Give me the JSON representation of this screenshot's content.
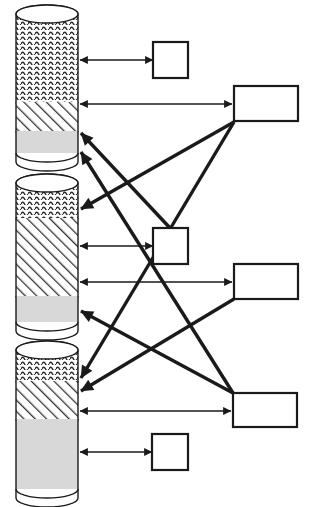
{
  "figure": {
    "title": "",
    "type": "block-diagram",
    "width": 314,
    "height": 507,
    "background": "#ffffff"
  },
  "style": {
    "stroke": "#1a1a1a",
    "thin_stroke_width": 1.6,
    "thick_stroke_width": 3.4,
    "box_stroke_width": 2.2,
    "cylinder_stroke_width": 1.4,
    "fill_white": "#ffffff",
    "fill_gray": "#d8d8d8",
    "hatch_color": "#333333",
    "wave_color": "#2b2b2b"
  },
  "cylinders": [
    {
      "name": "cylinder-top",
      "x": 16,
      "y": 14,
      "width": 62,
      "height": 148,
      "ellipse_ry": 9,
      "segments": [
        {
          "name": "wave-segment",
          "pattern": "wavy",
          "from": 14,
          "to": 102,
          "fill": "#ffffff"
        },
        {
          "name": "hatch-segment",
          "pattern": "diagonal-hatch",
          "from": 102,
          "to": 131,
          "fill": "#ffffff"
        },
        {
          "name": "solid-segment",
          "pattern": "solid-gray",
          "from": 131,
          "to": 153,
          "fill": "#d8d8d8"
        }
      ]
    },
    {
      "name": "cylinder-middle",
      "x": 16,
      "y": 183,
      "width": 62,
      "height": 148,
      "ellipse_ry": 9,
      "segments": [
        {
          "name": "wave-segment",
          "pattern": "wavy",
          "from": 183,
          "to": 218,
          "fill": "#ffffff"
        },
        {
          "name": "hatch-segment",
          "pattern": "diagonal-hatch",
          "from": 218,
          "to": 296,
          "fill": "#ffffff"
        },
        {
          "name": "solid-segment",
          "pattern": "solid-gray",
          "from": 296,
          "to": 322,
          "fill": "#d8d8d8"
        }
      ]
    },
    {
      "name": "cylinder-bottom",
      "x": 16,
      "y": 350,
      "width": 62,
      "height": 148,
      "ellipse_ry": 9,
      "segments": [
        {
          "name": "wave-segment",
          "pattern": "wavy",
          "from": 350,
          "to": 381,
          "fill": "#ffffff"
        },
        {
          "name": "hatch-segment",
          "pattern": "diagonal-hatch",
          "from": 381,
          "to": 419,
          "fill": "#ffffff"
        },
        {
          "name": "solid-segment",
          "pattern": "solid-gray",
          "from": 419,
          "to": 489,
          "fill": "#d8d8d8"
        }
      ]
    }
  ],
  "boxes": [
    {
      "name": "small-box-top",
      "label": "",
      "x": 153,
      "y": 42,
      "width": 35,
      "height": 36,
      "shape": "square"
    },
    {
      "name": "wide-box-top",
      "label": "",
      "x": 234,
      "y": 86,
      "width": 64,
      "height": 35,
      "shape": "rectangle"
    },
    {
      "name": "small-box-middle",
      "label": "",
      "x": 153,
      "y": 228,
      "width": 35,
      "height": 36,
      "shape": "square"
    },
    {
      "name": "wide-box-middle",
      "label": "",
      "x": 234,
      "y": 264,
      "width": 64,
      "height": 35,
      "shape": "rectangle"
    },
    {
      "name": "wide-box-bottom",
      "label": "",
      "x": 233,
      "y": 393,
      "width": 64,
      "height": 34,
      "shape": "rectangle"
    },
    {
      "name": "small-box-bottom",
      "label": "",
      "x": 152,
      "y": 434,
      "width": 36,
      "height": 36,
      "shape": "square"
    }
  ],
  "connections": [
    {
      "name": "link-cyl-top-wave-to-small-box-top",
      "kind": "thin",
      "arrows": "both",
      "from": {
        "x": 153,
        "y": 60
      },
      "to": {
        "x": 80,
        "y": 60
      }
    },
    {
      "name": "link-cyl-top-hatch-to-wide-box-top",
      "kind": "thin",
      "arrows": "both",
      "from": {
        "x": 232,
        "y": 104
      },
      "to": {
        "x": 80,
        "y": 104
      }
    },
    {
      "name": "link-cyl-mid-hatch-to-small-box-middle",
      "kind": "thin",
      "arrows": "both",
      "from": {
        "x": 153,
        "y": 246
      },
      "to": {
        "x": 80,
        "y": 246
      }
    },
    {
      "name": "link-cyl-mid-hatch-low-to-wide-box-middle",
      "kind": "thin",
      "arrows": "both",
      "from": {
        "x": 232,
        "y": 282
      },
      "to": {
        "x": 80,
        "y": 282
      }
    },
    {
      "name": "link-cyl-bottom-hatch-to-wide-box-bottom",
      "kind": "thin",
      "arrows": "both",
      "from": {
        "x": 231,
        "y": 411
      },
      "to": {
        "x": 80,
        "y": 411
      }
    },
    {
      "name": "link-cyl-bottom-solid-to-small-box-bottom",
      "kind": "thin",
      "arrows": "both",
      "from": {
        "x": 152,
        "y": 452
      },
      "to": {
        "x": 80,
        "y": 452
      }
    },
    {
      "name": "link-wide-box-top-to-cyl-mid-wave",
      "kind": "thick",
      "arrows": "end",
      "from": {
        "x": 234,
        "y": 122
      },
      "to": {
        "x": 81,
        "y": 209
      }
    },
    {
      "name": "link-wide-box-top-to-cyl-bottom-wave",
      "kind": "thick",
      "arrows": "end",
      "from": {
        "x": 234,
        "y": 122
      },
      "to": {
        "x": 81,
        "y": 378
      }
    },
    {
      "name": "link-small-box-middle-to-cyl-top-hatch",
      "kind": "thick",
      "arrows": "end",
      "from": {
        "x": 170,
        "y": 228
      },
      "to": {
        "x": 81,
        "y": 133
      }
    },
    {
      "name": "link-wide-box-middle-to-cyl-bottom-hatch",
      "kind": "thick",
      "arrows": "end",
      "from": {
        "x": 234,
        "y": 299
      },
      "to": {
        "x": 81,
        "y": 391
      }
    },
    {
      "name": "link-wide-box-bottom-to-cyl-top-solid",
      "kind": "thick",
      "arrows": "end",
      "from": {
        "x": 233,
        "y": 393
      },
      "to": {
        "x": 81,
        "y": 152
      }
    },
    {
      "name": "link-wide-box-bottom-to-cyl-mid-solid",
      "kind": "thick",
      "arrows": "end",
      "from": {
        "x": 233,
        "y": 393
      },
      "to": {
        "x": 81,
        "y": 311
      }
    }
  ]
}
